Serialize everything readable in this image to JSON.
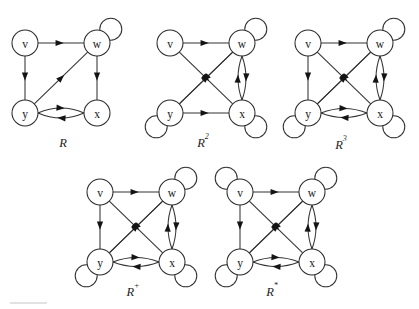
{
  "figure": {
    "kind": "directed-graph-collection",
    "background_color": "#ffffff",
    "node_fill": "#ffffff",
    "node_stroke": "#2b2b2b",
    "edge_color": "#333333",
    "arrow_color": "#141414",
    "footer_rule_color": "#d8d8d8",
    "node_radius": 13,
    "loop_radius": 11
  },
  "graphs": [
    {
      "id": "graph-R",
      "caption": "R",
      "caption_base": "R",
      "caption_sup": "",
      "caption_x": 63,
      "caption_y": 147,
      "nodes": [
        {
          "id": "v",
          "label": "v",
          "x": 25,
          "y": 43
        },
        {
          "id": "w",
          "label": "w",
          "x": 97,
          "y": 43
        },
        {
          "id": "y",
          "label": "y",
          "x": 25,
          "y": 113
        },
        {
          "id": "x",
          "label": "x",
          "x": 97,
          "y": 113
        }
      ],
      "edges": [
        {
          "from": "v",
          "to": "w",
          "curve": 0
        },
        {
          "from": "v",
          "to": "y",
          "curve": 0
        },
        {
          "from": "w",
          "to": "x",
          "curve": 0
        },
        {
          "from": "y",
          "to": "w",
          "curve": 0
        },
        {
          "from": "y",
          "to": "x",
          "curve": -10
        },
        {
          "from": "x",
          "to": "y",
          "curve": -10
        }
      ],
      "loops": [
        {
          "at": "w",
          "dir": "ne"
        }
      ]
    },
    {
      "id": "graph-R2",
      "caption": "R2",
      "caption_base": "R",
      "caption_sup": "2",
      "caption_x": 203,
      "caption_y": 147,
      "nodes": [
        {
          "id": "v",
          "label": "v",
          "x": 170,
          "y": 43
        },
        {
          "id": "w",
          "label": "w",
          "x": 242,
          "y": 43
        },
        {
          "id": "y",
          "label": "y",
          "x": 170,
          "y": 113
        },
        {
          "id": "x",
          "label": "x",
          "x": 242,
          "y": 113
        }
      ],
      "edges": [
        {
          "from": "v",
          "to": "w",
          "curve": 0
        },
        {
          "from": "v",
          "to": "x",
          "curve": 0
        },
        {
          "from": "y",
          "to": "w",
          "curve": 0
        },
        {
          "from": "y",
          "to": "x",
          "curve": 0
        },
        {
          "from": "w",
          "to": "y",
          "curve": 0
        },
        {
          "from": "w",
          "to": "x",
          "curve": -8
        },
        {
          "from": "x",
          "to": "w",
          "curve": -8
        }
      ],
      "loops": [
        {
          "at": "w",
          "dir": "ne"
        },
        {
          "at": "x",
          "dir": "se"
        },
        {
          "at": "y",
          "dir": "sw"
        }
      ]
    },
    {
      "id": "graph-R3",
      "caption": "R3",
      "caption_base": "R",
      "caption_sup": "3",
      "caption_x": 341,
      "caption_y": 149,
      "nodes": [
        {
          "id": "v",
          "label": "v",
          "x": 308,
          "y": 43
        },
        {
          "id": "w",
          "label": "w",
          "x": 380,
          "y": 43
        },
        {
          "id": "y",
          "label": "y",
          "x": 308,
          "y": 113
        },
        {
          "id": "x",
          "label": "x",
          "x": 380,
          "y": 113
        }
      ],
      "edges": [
        {
          "from": "v",
          "to": "w",
          "curve": 0
        },
        {
          "from": "v",
          "to": "y",
          "curve": 0
        },
        {
          "from": "v",
          "to": "x",
          "curve": 0
        },
        {
          "from": "y",
          "to": "w",
          "curve": 0
        },
        {
          "from": "y",
          "to": "x",
          "curve": -9
        },
        {
          "from": "x",
          "to": "y",
          "curve": -9
        },
        {
          "from": "w",
          "to": "y",
          "curve": 0
        },
        {
          "from": "w",
          "to": "x",
          "curve": -8
        },
        {
          "from": "x",
          "to": "w",
          "curve": -8
        }
      ],
      "loops": [
        {
          "at": "w",
          "dir": "ne"
        },
        {
          "at": "x",
          "dir": "se"
        },
        {
          "at": "y",
          "dir": "sw"
        }
      ]
    },
    {
      "id": "graph-Rplus",
      "caption": "R+",
      "caption_base": "R",
      "caption_sup": "+",
      "caption_x": 133,
      "caption_y": 296,
      "nodes": [
        {
          "id": "v",
          "label": "v",
          "x": 100,
          "y": 192
        },
        {
          "id": "w",
          "label": "w",
          "x": 172,
          "y": 192
        },
        {
          "id": "y",
          "label": "y",
          "x": 100,
          "y": 262
        },
        {
          "id": "x",
          "label": "x",
          "x": 172,
          "y": 262
        }
      ],
      "edges": [
        {
          "from": "v",
          "to": "w",
          "curve": 0
        },
        {
          "from": "v",
          "to": "y",
          "curve": 0
        },
        {
          "from": "v",
          "to": "x",
          "curve": 0
        },
        {
          "from": "y",
          "to": "w",
          "curve": 0
        },
        {
          "from": "y",
          "to": "x",
          "curve": -9
        },
        {
          "from": "x",
          "to": "y",
          "curve": -9
        },
        {
          "from": "w",
          "to": "y",
          "curve": 0
        },
        {
          "from": "w",
          "to": "x",
          "curve": -8
        },
        {
          "from": "x",
          "to": "w",
          "curve": -8
        }
      ],
      "loops": [
        {
          "at": "w",
          "dir": "ne"
        },
        {
          "at": "x",
          "dir": "se"
        },
        {
          "at": "y",
          "dir": "sw"
        }
      ]
    },
    {
      "id": "graph-Rstar",
      "caption": "R*",
      "caption_base": "R",
      "caption_sup": "*",
      "caption_x": 272,
      "caption_y": 296,
      "nodes": [
        {
          "id": "v",
          "label": "v",
          "x": 240,
          "y": 192
        },
        {
          "id": "w",
          "label": "w",
          "x": 312,
          "y": 192
        },
        {
          "id": "y",
          "label": "y",
          "x": 240,
          "y": 262
        },
        {
          "id": "x",
          "label": "x",
          "x": 312,
          "y": 262
        }
      ],
      "edges": [
        {
          "from": "v",
          "to": "w",
          "curve": 0
        },
        {
          "from": "v",
          "to": "y",
          "curve": 0
        },
        {
          "from": "v",
          "to": "x",
          "curve": 0
        },
        {
          "from": "y",
          "to": "w",
          "curve": 0
        },
        {
          "from": "y",
          "to": "x",
          "curve": -9
        },
        {
          "from": "x",
          "to": "y",
          "curve": -9
        },
        {
          "from": "w",
          "to": "y",
          "curve": 0
        },
        {
          "from": "w",
          "to": "x",
          "curve": -8
        },
        {
          "from": "x",
          "to": "w",
          "curve": -8
        }
      ],
      "loops": [
        {
          "at": "v",
          "dir": "nw"
        },
        {
          "at": "w",
          "dir": "ne"
        },
        {
          "at": "x",
          "dir": "se"
        },
        {
          "at": "y",
          "dir": "sw"
        }
      ]
    }
  ],
  "footer_rule": {
    "x1": 10,
    "y1": 303,
    "x2": 47,
    "y2": 303
  }
}
